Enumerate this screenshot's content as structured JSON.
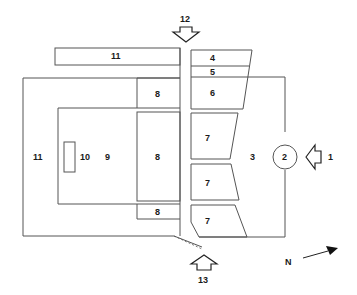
{
  "diagram": {
    "type": "site-plan",
    "labels": {
      "strip_top": "11",
      "outer_left": "11",
      "small_rect": "10",
      "inner_area": "9",
      "block_8_top": "8",
      "block_8_middle": "8",
      "block_8_bottom": "8",
      "block_4": "4",
      "block_5": "5",
      "block_6": "6",
      "block_7_a": "7",
      "block_7_b": "7",
      "block_7_c": "7",
      "open_area": "3",
      "circle": "2",
      "entrance_right": "1",
      "entrance_top": "12",
      "entrance_bottom": "13",
      "north": "N"
    },
    "colors": {
      "line": "#555555",
      "text": "#1a1a1a",
      "background": "#ffffff"
    }
  }
}
